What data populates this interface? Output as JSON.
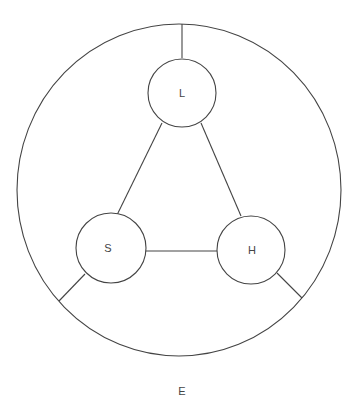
{
  "diagram": {
    "environment": {
      "label": "E"
    },
    "nodes": [
      {
        "id": "L",
        "label": "L"
      },
      {
        "id": "S",
        "label": "S"
      },
      {
        "id": "H",
        "label": "H"
      }
    ],
    "edges": [
      {
        "from": "L",
        "to": "S"
      },
      {
        "from": "L",
        "to": "H"
      },
      {
        "from": "S",
        "to": "H"
      },
      {
        "from": "L",
        "to": "boundary"
      },
      {
        "from": "S",
        "to": "boundary"
      },
      {
        "from": "H",
        "to": "boundary"
      }
    ],
    "colors": {
      "stroke": "#444444",
      "background": "#ffffff"
    }
  }
}
